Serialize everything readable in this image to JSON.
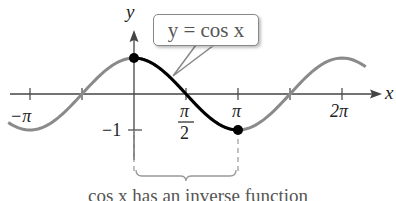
{
  "chart_data": {
    "type": "line",
    "title": "",
    "xlabel": "x",
    "ylabel": "y",
    "xlim": [
      -3.8,
      7.0
    ],
    "ylim": [
      -1.3,
      1.3
    ],
    "x_ticks": [
      "-π",
      "π/2",
      "π",
      "2π"
    ],
    "y_ticks": [
      "-1"
    ],
    "series": [
      {
        "name": "y = cos x (full)",
        "color": "#8a8a8a",
        "x_range": [
          -3.8,
          7.0
        ],
        "function": "cos(x)"
      },
      {
        "name": "restricted cos x on [0, π]",
        "color": "#000000",
        "x_range": [
          0,
          3.14159
        ],
        "function": "cos(x)"
      }
    ],
    "points": [
      {
        "x": 0,
        "y": 1,
        "label": "(0, 1)"
      },
      {
        "x": 3.14159,
        "y": -1,
        "label": "(π, -1)"
      }
    ],
    "annotations": [
      "y = cos x",
      "cos x has an inverse function"
    ],
    "grid": false
  },
  "labels": {
    "y_axis": "y",
    "x_axis": "x",
    "neg_pi": "−π",
    "pi_over_2_num": "π",
    "pi_over_2_den": "2",
    "pi": "π",
    "two_pi": "2π",
    "neg_one": "−1",
    "callout": "y = cos x",
    "caption": "cos x has an inverse function"
  },
  "colors": {
    "gray_curve": "#8a8a8a",
    "black_curve": "#000000",
    "axis": "#444444"
  }
}
